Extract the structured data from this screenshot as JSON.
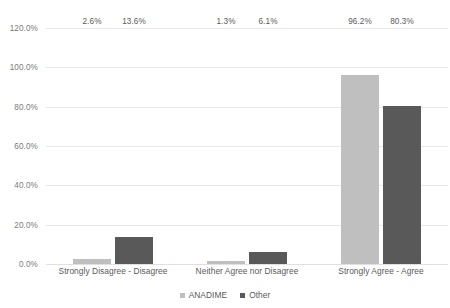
{
  "chart_data": {
    "type": "bar",
    "title": "",
    "xlabel": "",
    "ylabel": "",
    "ylim": [
      0,
      120
    ],
    "ytick_step": 20,
    "ytick_labels": [
      "0.0%",
      "20.0%",
      "40.0%",
      "60.0%",
      "80.0%",
      "100.0%",
      "120.0%"
    ],
    "ytick_values": [
      0,
      20,
      40,
      60,
      80,
      100,
      120
    ],
    "grid": true,
    "legend_position": "bottom",
    "categories": [
      "Strongly Disagree - Disagree",
      "Neither Agree nor Disagree",
      "Strongly Agree - Agree"
    ],
    "series": [
      {
        "name": "ANADIME",
        "color": "#bfbfbf",
        "values": [
          2.6,
          1.3,
          96.2
        ],
        "labels": [
          "2.6%",
          "1.3%",
          "96.2%"
        ]
      },
      {
        "name": "Other",
        "color": "#595959",
        "values": [
          13.6,
          6.1,
          80.3
        ],
        "labels": [
          "13.6%",
          "6.1%",
          "80.3%"
        ]
      }
    ]
  },
  "colors": {
    "series_anadime": "#bfbfbf",
    "series_other": "#595959",
    "gridline": "#e8e8e8",
    "text": "#5a5a5a",
    "background": "#ffffff"
  }
}
